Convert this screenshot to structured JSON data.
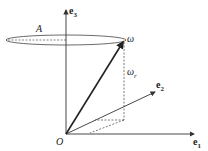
{
  "diagram": {
    "labels": {
      "e3": "e",
      "e3_sub": "3",
      "e2": "e",
      "e2_sub": "2",
      "e1": "e",
      "e1_sub": "1",
      "origin": "O",
      "A": "A",
      "omega": "ω",
      "omega_r": "ω",
      "omega_r_sub": "r"
    },
    "colors": {
      "line": "#333333"
    }
  }
}
